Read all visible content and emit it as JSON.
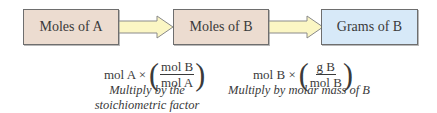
{
  "boxes": [
    {
      "label": "Moles of A",
      "fill": "#ecdcd0"
    },
    {
      "label": "Moles of B",
      "fill": "#ecdcd0"
    },
    {
      "label": "Grams of B",
      "fill": "#d7e9f8"
    }
  ],
  "arrows": {
    "fill": "#fbf6c4",
    "stroke": "#8a8a8a"
  },
  "steps": [
    {
      "prefix": "mol A ×",
      "numerator": "mol B",
      "denominator": "mol A",
      "caption_line1": "Multiply by the",
      "caption_line2": "stoichiometric factor"
    },
    {
      "prefix": "mol B ×",
      "numerator": "g B",
      "denominator": "mol B",
      "caption_line1": "Multiply by molar mass of B"
    }
  ]
}
